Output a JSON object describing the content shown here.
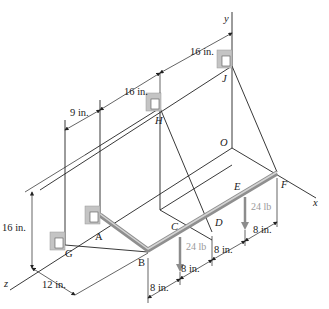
{
  "figure": {
    "axes": {
      "x": "x",
      "y": "y",
      "z": "z",
      "origin": "O"
    },
    "points": {
      "A": "A",
      "B": "B",
      "C": "C",
      "D": "D",
      "E": "E",
      "F": "F",
      "G": "G",
      "H": "H",
      "J": "J"
    },
    "loads": [
      {
        "at": "C",
        "label": "24 lb"
      },
      {
        "at": "E",
        "label": "24 lb"
      }
    ],
    "dimensions": {
      "top_right": "16 in.",
      "top_middle": "16 in.",
      "top_left": "9 in.",
      "height_left": "16 in.",
      "bottom_left": "12 in.",
      "bottom_1": "8 in.",
      "bottom_2": "8 in.",
      "bottom_3": "8 in.",
      "bottom_4": "8 in."
    },
    "colors": {
      "line": "#222222",
      "rod": "#9a9a9a",
      "rod_highlight": "#d0d0d0",
      "load_arrow": "#8c8c8c",
      "bracket": "#b8b8b8"
    }
  }
}
